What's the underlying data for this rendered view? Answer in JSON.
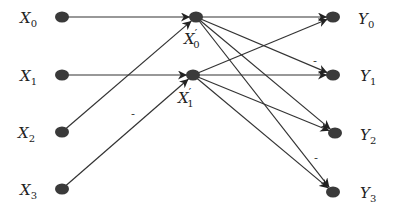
{
  "diagram": {
    "type": "signal-flow-graph",
    "nodes": [
      {
        "id": "X0",
        "base": "X",
        "sub": "0",
        "prime": false,
        "x": 62,
        "y": 17,
        "label_x": 20,
        "label_y": 23
      },
      {
        "id": "X1",
        "base": "X",
        "sub": "1",
        "prime": false,
        "x": 62,
        "y": 75,
        "label_x": 20,
        "label_y": 81
      },
      {
        "id": "X2",
        "base": "X",
        "sub": "2",
        "prime": false,
        "x": 62,
        "y": 132,
        "label_x": 18,
        "label_y": 138
      },
      {
        "id": "X3",
        "base": "X",
        "sub": "3",
        "prime": false,
        "x": 62,
        "y": 189,
        "label_x": 20,
        "label_y": 195
      },
      {
        "id": "X'0",
        "base": "X",
        "sub": "0",
        "prime": true,
        "x": 196,
        "y": 17,
        "label_x": 184,
        "label_y": 44
      },
      {
        "id": "X'1",
        "base": "X",
        "sub": "1",
        "prime": true,
        "x": 193,
        "y": 75,
        "label_x": 178,
        "label_y": 103
      },
      {
        "id": "Y0",
        "base": "Y",
        "sub": "0",
        "prime": false,
        "x": 333,
        "y": 17,
        "label_x": 358,
        "label_y": 24
      },
      {
        "id": "Y1",
        "base": "Y",
        "sub": "1",
        "prime": false,
        "x": 333,
        "y": 75,
        "label_x": 360,
        "label_y": 81
      },
      {
        "id": "Y2",
        "base": "Y",
        "sub": "2",
        "prime": false,
        "x": 335,
        "y": 133,
        "label_x": 360,
        "label_y": 140
      },
      {
        "id": "Y3",
        "base": "Y",
        "sub": "3",
        "prime": false,
        "x": 333,
        "y": 192,
        "label_x": 360,
        "label_y": 198
      }
    ],
    "edges": [
      {
        "from": "X0",
        "to": "X'0",
        "sign": ""
      },
      {
        "from": "X2",
        "to": "X'0",
        "sign": ""
      },
      {
        "from": "X1",
        "to": "X'1",
        "sign": ""
      },
      {
        "from": "X3",
        "to": "X'1",
        "sign": "-",
        "sign_x": 131,
        "sign_y": 117
      },
      {
        "from": "X'0",
        "to": "Y0",
        "sign": ""
      },
      {
        "from": "X'0",
        "to": "Y1",
        "sign": "-",
        "sign_x": 313,
        "sign_y": 64
      },
      {
        "from": "X'0",
        "to": "Y2",
        "sign": ""
      },
      {
        "from": "X'0",
        "to": "Y3",
        "sign": ""
      },
      {
        "from": "X'1",
        "to": "Y0",
        "sign": ""
      },
      {
        "from": "X'1",
        "to": "Y1",
        "sign": ""
      },
      {
        "from": "X'1",
        "to": "Y2",
        "sign": ""
      },
      {
        "from": "X'1",
        "to": "Y3",
        "sign": "-",
        "sign_x": 314,
        "sign_y": 161
      }
    ]
  }
}
